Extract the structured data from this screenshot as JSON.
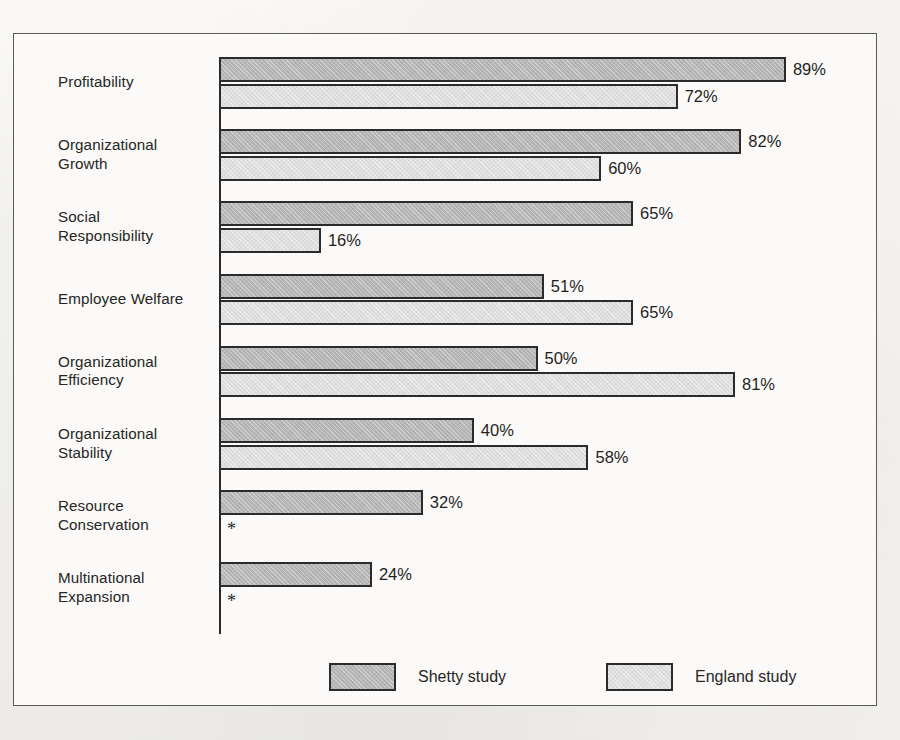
{
  "chart_data": {
    "type": "bar",
    "orientation": "horizontal",
    "title": "",
    "subtitle": "",
    "xlabel": "",
    "ylabel": "",
    "xlim": [
      0,
      100
    ],
    "grid": false,
    "value_suffix": "%",
    "legend_position": "bottom",
    "categories": [
      "Profitability",
      "Organizational Growth",
      "Social Responsibility",
      "Employee Welfare",
      "Organizational Efficiency",
      "Organizational Stability",
      "Resource Conservation",
      "Multinational Expansion"
    ],
    "series": [
      {
        "name": "Shetty study",
        "color": "#b6b6b6",
        "values": [
          89,
          82,
          65,
          51,
          50,
          40,
          32,
          24
        ],
        "labels": [
          "89%",
          "82%",
          "65%",
          "51%",
          "50%",
          "40%",
          "32%",
          "24%"
        ]
      },
      {
        "name": "England study",
        "color": "#dedede",
        "values": [
          72,
          60,
          16,
          65,
          81,
          58,
          null,
          null
        ],
        "labels": [
          "72%",
          "60%",
          "16%",
          "65%",
          "81%",
          "58%",
          "*",
          "*"
        ]
      }
    ],
    "missing_marker": "*"
  },
  "categories_display": [
    {
      "line1": "Profitability",
      "line2": ""
    },
    {
      "line1": "Organizational",
      "line2": "Growth"
    },
    {
      "line1": "Social",
      "line2": "Responsibility"
    },
    {
      "line1": "Employee Welfare",
      "line2": ""
    },
    {
      "line1": "Organizational",
      "line2": "Efficiency"
    },
    {
      "line1": "Organizational",
      "line2": "Stability"
    },
    {
      "line1": "Resource",
      "line2": "Conservation"
    },
    {
      "line1": "Multinational",
      "line2": "Expansion"
    }
  ],
  "legend": [
    {
      "label": "Shetty  study",
      "color": "#b6b6b6"
    },
    {
      "label": "England study",
      "color": "#dedede"
    }
  ],
  "style": {
    "frame_color": "#5b5b5b",
    "axis_color": "#2b2b2b",
    "bar_outline": "#2b2b2b",
    "text_color": "#262626",
    "background": "#f7f6f4"
  }
}
